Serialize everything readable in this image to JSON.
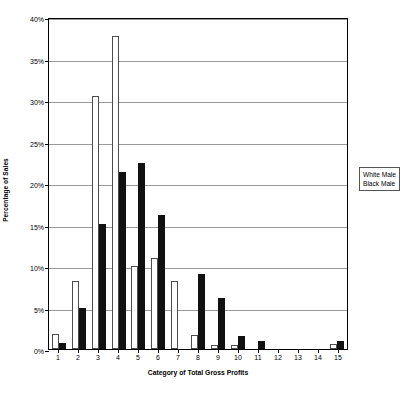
{
  "chart_data": {
    "type": "bar",
    "title": "",
    "xlabel": "Category of Total Gross Profits",
    "ylabel": "Percentage of Sales",
    "categories": [
      "1",
      "2",
      "3",
      "4",
      "5",
      "6",
      "7",
      "8",
      "9",
      "10",
      "11",
      "12",
      "13",
      "14",
      "15"
    ],
    "ylim": [
      0,
      40
    ],
    "ytick_labels": [
      "0%",
      "5%",
      "10%",
      "15%",
      "20%",
      "25%",
      "30%",
      "35%",
      "40%"
    ],
    "ytick_values": [
      0,
      5,
      10,
      15,
      20,
      25,
      30,
      35,
      40
    ],
    "ytick_suffix": "%",
    "grid": true,
    "legend_position": "right",
    "series": [
      {
        "name": "White Male",
        "color": "#ffffff",
        "edge_color": "#4d4d4d",
        "values": [
          1.8,
          8.2,
          30.5,
          37.7,
          10.0,
          11.0,
          8.2,
          1.7,
          0.5,
          0.5,
          0.0,
          0.0,
          0.0,
          0.0,
          0.6
        ]
      },
      {
        "name": "Black Male",
        "color": "#111111",
        "edge_color": "#111111",
        "values": [
          0.7,
          5.0,
          15.1,
          21.3,
          22.4,
          16.2,
          0.0,
          9.0,
          6.1,
          1.6,
          1.0,
          0.0,
          0.0,
          0.0,
          1.0
        ]
      }
    ]
  },
  "legend": {
    "items": [
      {
        "label": "White Male"
      },
      {
        "label": "Black Male"
      }
    ]
  },
  "caption": {
    "text": ""
  }
}
